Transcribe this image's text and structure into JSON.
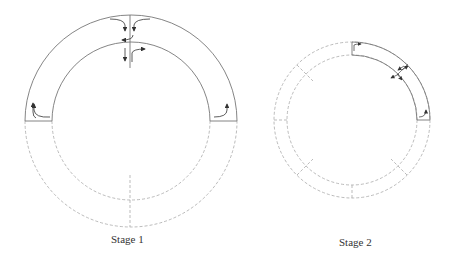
{
  "diagram": {
    "stages": [
      {
        "label": "Stage 1",
        "center": [
          131,
          121
        ],
        "outer_radius": 106,
        "inner_radius": 79,
        "solid_part": "upper half",
        "dashed_part": "lower half",
        "arrows": "flow arrows at top crossing and both sides"
      },
      {
        "label": "Stage 2",
        "center": [
          352,
          120
        ],
        "outer_radius": 78,
        "inner_radius": 65,
        "solid_part": "upper-right quarter",
        "dashed_part": "remaining three quarters",
        "arrows": "flow arrows at top, at 45° crossing, and right side"
      }
    ],
    "colors": {
      "solid_line": "#777777",
      "dashed_line": "#aaaaaa",
      "arrow": "#333333"
    }
  }
}
